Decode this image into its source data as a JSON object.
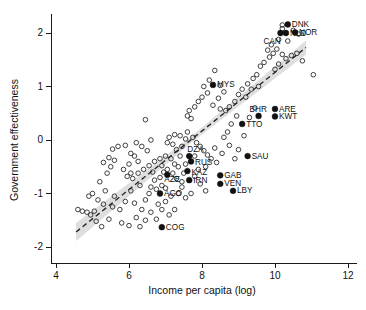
{
  "chart_data": {
    "type": "scatter",
    "title": "",
    "xlabel": "Income per capita (log)",
    "ylabel": "Government effectiveness",
    "xlim": [
      3.6,
      12.4
    ],
    "ylim": [
      -2.35,
      2.35
    ],
    "xticks": [
      4,
      6,
      8,
      10,
      12
    ],
    "yticks": [
      2,
      1,
      0,
      -1,
      -2
    ],
    "xtick_labels": [
      "4",
      "6",
      "8",
      "10",
      "12"
    ],
    "ytick_labels": [
      "2",
      "1",
      "0",
      "-1",
      "-2"
    ],
    "grid": false,
    "legend": "none",
    "marker_open_meaning": "unlabelled countries",
    "marker_filled_meaning": "labelled resource-rich countries",
    "trend": {
      "style": "dashed",
      "color": "#242424",
      "x_start": 4.55,
      "y_start": -1.72,
      "x_end": 10.85,
      "y_end": 1.73,
      "band_color": "#c9c9c9",
      "band_half_width_start": 0.17,
      "band_half_width_mid": 0.06,
      "band_half_width_end": 0.13
    },
    "labeled_points": [
      {
        "label": "DNK",
        "x": 10.35,
        "y": 2.16,
        "label_dx": 4,
        "label_dy": 2.6
      },
      {
        "label": "NOR",
        "x": 10.55,
        "y": 2.01,
        "label_dx": 4,
        "label_dy": 2.6
      },
      {
        "label": "NLD",
        "x": 10.3,
        "y": 2.0,
        "label_dx": 4,
        "label_dy": 2.6
      },
      {
        "label": "CAN",
        "x": 10.15,
        "y": 2.0,
        "label_dx": -17,
        "label_dy": 11
      },
      {
        "label": "MYS",
        "x": 8.3,
        "y": 1.03,
        "label_dx": 4,
        "label_dy": 2.6
      },
      {
        "label": "ARE",
        "x": 10.0,
        "y": 0.58,
        "label_dx": 4,
        "label_dy": 2.6
      },
      {
        "label": "BHR",
        "x": 9.55,
        "y": 0.45,
        "label_dx": -9,
        "label_dy": -4
      },
      {
        "label": "KWT",
        "x": 10.0,
        "y": 0.44,
        "label_dx": 4,
        "label_dy": 2.6
      },
      {
        "label": "TTO",
        "x": 9.1,
        "y": 0.3,
        "label_dx": 4,
        "label_dy": 2.6
      },
      {
        "label": "SAU",
        "x": 9.25,
        "y": -0.3,
        "label_dx": 4,
        "label_dy": 2.6
      },
      {
        "label": "DZA",
        "x": 7.65,
        "y": -0.3,
        "label_dx": -2,
        "label_dy": -4
      },
      {
        "label": "RUS",
        "x": 7.7,
        "y": -0.4,
        "label_dx": 4,
        "label_dy": 3.6
      },
      {
        "label": "KAZ",
        "x": 7.6,
        "y": -0.58,
        "label_dx": 4,
        "label_dy": 3.6
      },
      {
        "label": "GAB",
        "x": 8.5,
        "y": -0.66,
        "label_dx": 4,
        "label_dy": 2.6
      },
      {
        "label": "IRN",
        "x": 7.65,
        "y": -0.75,
        "label_dx": 4,
        "label_dy": 2.6
      },
      {
        "label": "AZE",
        "x": 7.05,
        "y": -0.65,
        "label_dx": -3,
        "label_dy": 7.5
      },
      {
        "label": "VEN",
        "x": 8.5,
        "y": -0.82,
        "label_dx": 4,
        "label_dy": 2.6
      },
      {
        "label": "LBY",
        "x": 8.85,
        "y": -0.95,
        "label_dx": 4,
        "label_dy": 2.6
      },
      {
        "label": "AGO",
        "x": 6.85,
        "y": -1.0,
        "label_dx": 4,
        "label_dy": 2.6
      },
      {
        "label": "COG",
        "x": 6.9,
        "y": -1.63,
        "label_dx": 4,
        "label_dy": 2.6
      }
    ],
    "unlabeled_points": [
      {
        "x": 4.72,
        "y": -1.33
      },
      {
        "x": 4.85,
        "y": -1.35
      },
      {
        "x": 4.95,
        "y": -1.4
      },
      {
        "x": 5.05,
        "y": -1.33
      },
      {
        "x": 4.9,
        "y": -1.05
      },
      {
        "x": 5.0,
        "y": -1.0
      },
      {
        "x": 5.15,
        "y": -1.12
      },
      {
        "x": 5.3,
        "y": -1.2
      },
      {
        "x": 5.45,
        "y": -1.48
      },
      {
        "x": 5.55,
        "y": -1.25
      },
      {
        "x": 5.6,
        "y": -1.05
      },
      {
        "x": 5.35,
        "y": -0.95
      },
      {
        "x": 5.2,
        "y": -0.78
      },
      {
        "x": 5.4,
        "y": -0.62
      },
      {
        "x": 5.5,
        "y": -0.5
      },
      {
        "x": 5.3,
        "y": -0.42
      },
      {
        "x": 5.45,
        "y": -0.33
      },
      {
        "x": 5.6,
        "y": -0.38
      },
      {
        "x": 5.55,
        "y": -0.17
      },
      {
        "x": 5.7,
        "y": -0.12
      },
      {
        "x": 5.9,
        "y": -0.1
      },
      {
        "x": 6.05,
        "y": -0.25
      },
      {
        "x": 6.15,
        "y": -0.3
      },
      {
        "x": 6.0,
        "y": -0.45
      },
      {
        "x": 5.85,
        "y": -0.55
      },
      {
        "x": 5.95,
        "y": -0.68
      },
      {
        "x": 6.1,
        "y": -0.72
      },
      {
        "x": 6.25,
        "y": -0.62
      },
      {
        "x": 6.4,
        "y": -0.55
      },
      {
        "x": 6.3,
        "y": -0.85
      },
      {
        "x": 6.05,
        "y": -0.95
      },
      {
        "x": 5.9,
        "y": -1.15
      },
      {
        "x": 5.75,
        "y": -1.3
      },
      {
        "x": 5.8,
        "y": -1.55
      },
      {
        "x": 6.0,
        "y": -1.6
      },
      {
        "x": 6.2,
        "y": -1.45
      },
      {
        "x": 6.35,
        "y": -1.3
      },
      {
        "x": 6.45,
        "y": -1.12
      },
      {
        "x": 6.55,
        "y": -1.0
      },
      {
        "x": 6.6,
        "y": -0.88
      },
      {
        "x": 6.75,
        "y": -0.92
      },
      {
        "x": 6.9,
        "y": -0.85
      },
      {
        "x": 7.0,
        "y": -0.9
      },
      {
        "x": 6.7,
        "y": -0.75
      },
      {
        "x": 6.85,
        "y": -0.7
      },
      {
        "x": 6.95,
        "y": -0.6
      },
      {
        "x": 7.05,
        "y": -0.55
      },
      {
        "x": 6.65,
        "y": -0.6
      },
      {
        "x": 6.55,
        "y": -0.48
      },
      {
        "x": 6.7,
        "y": -0.4
      },
      {
        "x": 6.85,
        "y": -0.35
      },
      {
        "x": 7.0,
        "y": -0.3
      },
      {
        "x": 7.15,
        "y": -0.35
      },
      {
        "x": 7.25,
        "y": -0.45
      },
      {
        "x": 7.35,
        "y": -0.5
      },
      {
        "x": 7.2,
        "y": -0.62
      },
      {
        "x": 7.3,
        "y": -0.72
      },
      {
        "x": 7.45,
        "y": -0.78
      },
      {
        "x": 7.5,
        "y": -0.62
      },
      {
        "x": 7.4,
        "y": -0.3
      },
      {
        "x": 7.3,
        "y": -0.18
      },
      {
        "x": 7.45,
        "y": -0.12
      },
      {
        "x": 7.2,
        "y": -0.08
      },
      {
        "x": 7.05,
        "y": -0.05
      },
      {
        "x": 7.1,
        "y": 0.05
      },
      {
        "x": 7.25,
        "y": 0.1
      },
      {
        "x": 7.4,
        "y": 0.08
      },
      {
        "x": 7.55,
        "y": 0.02
      },
      {
        "x": 7.6,
        "y": 0.15
      },
      {
        "x": 7.75,
        "y": 0.05
      },
      {
        "x": 7.85,
        "y": -0.05
      },
      {
        "x": 7.95,
        "y": -0.12
      },
      {
        "x": 8.05,
        "y": -0.2
      },
      {
        "x": 8.15,
        "y": -0.28
      },
      {
        "x": 8.25,
        "y": -0.35
      },
      {
        "x": 8.4,
        "y": -0.42
      },
      {
        "x": 8.1,
        "y": -0.5
      },
      {
        "x": 7.9,
        "y": -0.55
      },
      {
        "x": 7.8,
        "y": -0.68
      },
      {
        "x": 7.95,
        "y": -0.82
      },
      {
        "x": 8.1,
        "y": -0.95
      },
      {
        "x": 7.7,
        "y": -1.0
      },
      {
        "x": 7.55,
        "y": -1.08
      },
      {
        "x": 7.35,
        "y": -1.0
      },
      {
        "x": 7.15,
        "y": -1.05
      },
      {
        "x": 7.0,
        "y": -1.15
      },
      {
        "x": 6.8,
        "y": -1.2
      },
      {
        "x": 6.6,
        "y": -1.35
      },
      {
        "x": 6.45,
        "y": -1.5
      },
      {
        "x": 6.3,
        "y": -1.62
      },
      {
        "x": 6.9,
        "y": -1.3
      },
      {
        "x": 7.1,
        "y": -1.4
      },
      {
        "x": 6.5,
        "y": -0.2
      },
      {
        "x": 6.35,
        "y": -0.12
      },
      {
        "x": 6.2,
        "y": -0.05
      },
      {
        "x": 6.45,
        "y": 0.38
      },
      {
        "x": 6.6,
        "y": 0.0
      },
      {
        "x": 7.6,
        "y": 0.45
      },
      {
        "x": 7.7,
        "y": 0.4
      },
      {
        "x": 7.65,
        "y": 0.55
      },
      {
        "x": 7.8,
        "y": 0.62
      },
      {
        "x": 7.9,
        "y": 0.72
      },
      {
        "x": 8.0,
        "y": 0.8
      },
      {
        "x": 8.15,
        "y": 0.88
      },
      {
        "x": 8.05,
        "y": 1.0
      },
      {
        "x": 8.2,
        "y": 1.12
      },
      {
        "x": 8.35,
        "y": 1.3
      },
      {
        "x": 8.5,
        "y": 1.02
      },
      {
        "x": 8.6,
        "y": 0.9
      },
      {
        "x": 8.45,
        "y": 0.78
      },
      {
        "x": 8.3,
        "y": 0.65
      },
      {
        "x": 8.5,
        "y": 0.58
      },
      {
        "x": 8.65,
        "y": 0.55
      },
      {
        "x": 8.75,
        "y": 0.62
      },
      {
        "x": 8.9,
        "y": 0.72
      },
      {
        "x": 9.0,
        "y": 0.85
      },
      {
        "x": 9.1,
        "y": 0.95
      },
      {
        "x": 9.25,
        "y": 1.05
      },
      {
        "x": 9.4,
        "y": 1.15
      },
      {
        "x": 9.5,
        "y": 1.22
      },
      {
        "x": 9.35,
        "y": 0.95
      },
      {
        "x": 9.2,
        "y": 0.8
      },
      {
        "x": 8.95,
        "y": 0.45
      },
      {
        "x": 8.8,
        "y": 0.3
      },
      {
        "x": 8.7,
        "y": 0.15
      },
      {
        "x": 8.6,
        "y": 0.05
      },
      {
        "x": 8.75,
        "y": -0.1
      },
      {
        "x": 8.55,
        "y": -0.25
      },
      {
        "x": 9.0,
        "y": -0.18
      },
      {
        "x": 9.6,
        "y": 1.38
      },
      {
        "x": 9.7,
        "y": 1.45
      },
      {
        "x": 9.85,
        "y": 1.55
      },
      {
        "x": 9.95,
        "y": 1.62
      },
      {
        "x": 10.05,
        "y": 1.7
      },
      {
        "x": 10.2,
        "y": 1.6
      },
      {
        "x": 10.3,
        "y": 1.52
      },
      {
        "x": 10.1,
        "y": 1.42
      },
      {
        "x": 10.0,
        "y": 1.32
      },
      {
        "x": 10.45,
        "y": 1.58
      },
      {
        "x": 10.6,
        "y": 1.62
      },
      {
        "x": 10.75,
        "y": 1.48
      },
      {
        "x": 11.05,
        "y": 1.22
      },
      {
        "x": 10.2,
        "y": 2.15
      },
      {
        "x": 10.2,
        "y": 2.08
      },
      {
        "x": 10.5,
        "y": 2.05
      },
      {
        "x": 10.65,
        "y": 1.98
      },
      {
        "x": 10.1,
        "y": 1.88
      },
      {
        "x": 9.9,
        "y": 1.78
      },
      {
        "x": 10.35,
        "y": 1.85
      },
      {
        "x": 9.8,
        "y": 1.68
      },
      {
        "x": 9.55,
        "y": 1.0
      },
      {
        "x": 9.45,
        "y": 0.6
      },
      {
        "x": 9.3,
        "y": 0.42
      },
      {
        "x": 4.6,
        "y": -1.3
      },
      {
        "x": 5.1,
        "y": -1.52
      },
      {
        "x": 5.25,
        "y": -1.62
      },
      {
        "x": 6.15,
        "y": -1.18
      },
      {
        "x": 6.75,
        "y": -1.48
      },
      {
        "x": 7.25,
        "y": -1.3
      },
      {
        "x": 8.35,
        "y": -0.15
      },
      {
        "x": 8.9,
        "y": -0.35
      },
      {
        "x": 9.15,
        "y": 0.08
      },
      {
        "x": 6.25,
        "y": -0.4
      },
      {
        "x": 6.9,
        "y": -0.48
      },
      {
        "x": 7.55,
        "y": -0.45
      },
      {
        "x": 7.45,
        "y": -0.88
      },
      {
        "x": 7.8,
        "y": -0.3
      },
      {
        "x": 6.05,
        "y": -0.62
      }
    ]
  }
}
